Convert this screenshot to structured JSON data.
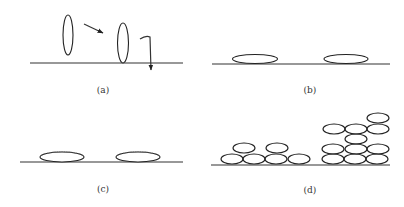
{
  "figure": {
    "colors": {
      "line": "#333333",
      "background": "#ffffff"
    },
    "panels": [
      {
        "id": "a",
        "label": "(a)",
        "baseline": {
          "x1": 30,
          "x2": 183,
          "y": 63
        },
        "ellipses": [
          {
            "cx": 68,
            "cy": 35,
            "rx": 5,
            "ry": 20
          },
          {
            "cx": 123,
            "cy": 43,
            "rx": 5.5,
            "ry": 20
          }
        ],
        "arrows": [
          {
            "name": "approach-arrow",
            "x1": 84,
            "y1": 24,
            "x2": 103,
            "y2": 33
          },
          {
            "name": "hook-arrow",
            "path": "M140,39 Q146,35 150,37 L151,70"
          }
        ],
        "label_pos": {
          "x": 103,
          "y": 93
        }
      },
      {
        "id": "b",
        "label": "(b)",
        "baseline": {
          "x1": 212,
          "x2": 390,
          "y": 64
        },
        "ellipses": [
          {
            "cx": 255,
            "cy": 59,
            "rx": 22.5,
            "ry": 4.5
          },
          {
            "cx": 346,
            "cy": 59,
            "rx": 22,
            "ry": 4.5
          }
        ],
        "label_pos": {
          "x": 310,
          "y": 93
        }
      },
      {
        "id": "c",
        "label": "(c)",
        "baseline": {
          "x1": 20,
          "x2": 183,
          "y": 162
        },
        "ellipses": [
          {
            "cx": 62,
            "cy": 157,
            "rx": 22,
            "ry": 5
          },
          {
            "cx": 138,
            "cy": 157,
            "rx": 22,
            "ry": 5
          }
        ],
        "label_pos": {
          "x": 103,
          "y": 192
        }
      },
      {
        "id": "d",
        "label": "(d)",
        "baseline": {
          "x1": 211,
          "x2": 390,
          "y": 165
        },
        "ellipses": [
          {
            "cx": 232,
            "cy": 159,
            "rx": 11,
            "ry": 5
          },
          {
            "cx": 254,
            "cy": 159,
            "rx": 11,
            "ry": 5
          },
          {
            "cx": 276,
            "cy": 159,
            "rx": 11,
            "ry": 5
          },
          {
            "cx": 299,
            "cy": 159,
            "rx": 11,
            "ry": 5
          },
          {
            "cx": 244,
            "cy": 148,
            "rx": 11,
            "ry": 5
          },
          {
            "cx": 277,
            "cy": 148,
            "rx": 11,
            "ry": 5
          },
          {
            "cx": 333,
            "cy": 159,
            "rx": 11,
            "ry": 5
          },
          {
            "cx": 355,
            "cy": 159,
            "rx": 11,
            "ry": 5
          },
          {
            "cx": 377,
            "cy": 159,
            "rx": 11,
            "ry": 5
          },
          {
            "cx": 333,
            "cy": 149,
            "rx": 11,
            "ry": 5
          },
          {
            "cx": 356,
            "cy": 149,
            "rx": 11,
            "ry": 5
          },
          {
            "cx": 378,
            "cy": 149,
            "rx": 11,
            "ry": 5
          },
          {
            "cx": 356,
            "cy": 139,
            "rx": 11,
            "ry": 5
          },
          {
            "cx": 334,
            "cy": 129,
            "rx": 11,
            "ry": 5
          },
          {
            "cx": 356,
            "cy": 129,
            "rx": 11,
            "ry": 5
          },
          {
            "cx": 378,
            "cy": 129,
            "rx": 11,
            "ry": 5
          },
          {
            "cx": 378,
            "cy": 118,
            "rx": 11,
            "ry": 5
          }
        ],
        "label_pos": {
          "x": 310,
          "y": 193
        }
      }
    ]
  }
}
